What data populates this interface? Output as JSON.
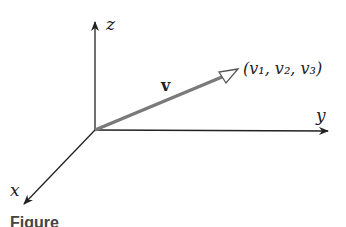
{
  "diagram": {
    "axes": {
      "x_label": "x",
      "y_label": "y",
      "z_label": "z"
    },
    "vector": {
      "label": "v",
      "endpoint_label": "(v₁, v₂, v₃)",
      "color": "#7a7a7a"
    },
    "axis_color": "#222222",
    "caption": "Figure"
  }
}
